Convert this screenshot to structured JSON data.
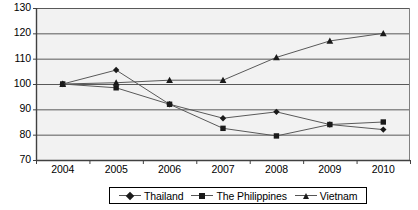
{
  "chart_data": {
    "type": "line",
    "title": "",
    "xlabel": "",
    "ylabel": "",
    "categories": [
      "2004",
      "2005",
      "2006",
      "2007",
      "2008",
      "2009",
      "2010"
    ],
    "ylim": [
      70,
      130
    ],
    "yticks": [
      70,
      80,
      90,
      100,
      110,
      120,
      130
    ],
    "grid": true,
    "legend_position": "bottom",
    "series": [
      {
        "name": "Thailand",
        "marker": "diamond",
        "color": "#1a1a1a",
        "values": [
          100,
          105.5,
          92,
          86.5,
          89,
          84,
          82
        ]
      },
      {
        "name": "The Philippines",
        "marker": "square",
        "color": "#1a1a1a",
        "values": [
          100,
          98.5,
          92,
          82.5,
          79.5,
          84,
          85
        ]
      },
      {
        "name": "Vietnam",
        "marker": "triangle",
        "color": "#1a1a1a",
        "values": [
          100,
          100.5,
          101.5,
          101.5,
          110.5,
          117,
          120
        ]
      }
    ]
  },
  "axis": {
    "y_labels": [
      "130",
      "120",
      "110",
      "100",
      "90",
      "80",
      "70"
    ],
    "x_labels": [
      "2004",
      "2005",
      "2006",
      "2007",
      "2008",
      "2009",
      "2010"
    ]
  },
  "legend": {
    "items": [
      {
        "label": "Thailand",
        "marker": "diamond"
      },
      {
        "label": "The Philippines",
        "marker": "square"
      },
      {
        "label": "Vietnam",
        "marker": "triangle"
      }
    ]
  },
  "style": {
    "plot_background": "#f2f2f2",
    "gridline_color": "#595959",
    "axis_color": "#404040",
    "series_color": "#1a1a1a"
  }
}
